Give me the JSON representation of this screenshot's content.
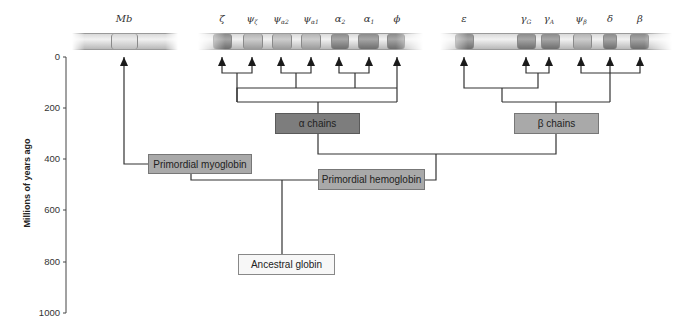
{
  "axis": {
    "title": "Millions of years ago",
    "ticks": [
      "0",
      "200",
      "400",
      "600",
      "800",
      "1000"
    ]
  },
  "chromosomes": {
    "myoglobin": {
      "genes": [
        {
          "label": "Mb",
          "sub": ""
        }
      ]
    },
    "alpha": {
      "genes": [
        {
          "label": "ζ",
          "sub": ""
        },
        {
          "label": "ψ",
          "sub": "ζ"
        },
        {
          "label": "ψ",
          "sub": "α2"
        },
        {
          "label": "ψ",
          "sub": "α1"
        },
        {
          "label": "α",
          "sub": "2"
        },
        {
          "label": "α",
          "sub": "1"
        },
        {
          "label": "ϕ",
          "sub": ""
        }
      ]
    },
    "beta": {
      "genes": [
        {
          "label": "ε",
          "sub": ""
        },
        {
          "label": "γ",
          "sub": "G"
        },
        {
          "label": "γ",
          "sub": "A"
        },
        {
          "label": "ψ",
          "sub": "β"
        },
        {
          "label": "δ",
          "sub": ""
        },
        {
          "label": "β",
          "sub": ""
        }
      ]
    }
  },
  "nodes": {
    "alpha_chains": "α chains",
    "beta_chains": "β chains",
    "primordial_myoglobin": "Primordial myoglobin",
    "primordial_hemoglobin": "Primordial hemoglobin",
    "ancestral_globin": "Ancestral globin"
  },
  "colors": {
    "line": "#333333",
    "box_dark": "#7d7d7d",
    "box_mid": "#a9a9a9",
    "box_light": "#f7f7f7"
  }
}
